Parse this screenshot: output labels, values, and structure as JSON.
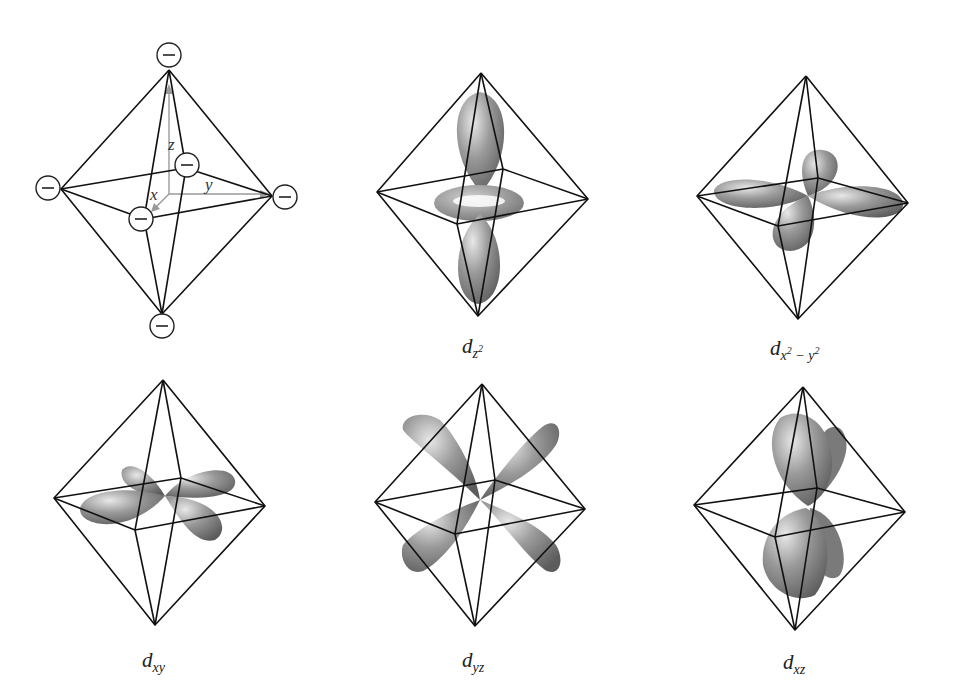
{
  "figure": {
    "ligand_field": {
      "ligand_symbol": "−",
      "axes": {
        "x": "x",
        "y": "y",
        "z": "z"
      }
    },
    "panels": [
      {
        "id": "ligands",
        "label": ""
      },
      {
        "id": "dz2",
        "label_main": "d",
        "label_sub": "z",
        "label_sup": "2"
      },
      {
        "id": "dx2y2",
        "label_main": "d",
        "label_sub_a": "x",
        "label_sup_a": "2",
        "label_sub_op": " − ",
        "label_sub_b": "y",
        "label_sup_b": "2"
      },
      {
        "id": "dxy",
        "label_main": "d",
        "label_sub": "xy"
      },
      {
        "id": "dyz",
        "label_main": "d",
        "label_sub": "yz"
      },
      {
        "id": "dxz",
        "label_main": "d",
        "label_sub": "xz"
      }
    ],
    "colors": {
      "lobe": "#8a8a8a",
      "lobe_highlight": "#e6e6e6",
      "lobe_shadow": "#5a5a5a",
      "edge": "#111111",
      "axis": "#9a9a9a"
    }
  }
}
